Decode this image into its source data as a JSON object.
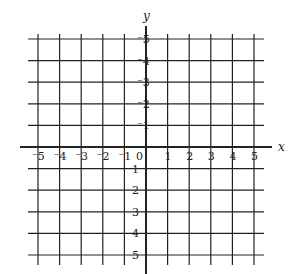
{
  "chart_data": {
    "type": "coordinate-grid",
    "title": "",
    "xlabel": "x",
    "ylabel": "y",
    "xlim": [
      -5,
      5
    ],
    "ylim": [
      -5,
      5
    ],
    "grid": true,
    "x_ticks": [
      -5,
      -4,
      -3,
      -2,
      -1,
      0,
      1,
      2,
      3,
      4,
      5
    ],
    "y_ticks": [
      -5,
      -4,
      -3,
      -2,
      -1,
      1,
      2,
      3,
      4,
      5
    ],
    "x_tick_labels": [
      "⁻5",
      "⁻4",
      "⁻3",
      "⁻2",
      "⁻1",
      "0",
      "1",
      "2",
      "3",
      "4",
      "5"
    ],
    "y_tick_labels": [
      "5",
      "4",
      "3",
      "2",
      "1",
      "⁻1",
      "⁻2",
      "⁻3",
      "⁻4",
      "⁻5"
    ],
    "origin_label": "0"
  },
  "colors": {
    "line": "#222222",
    "background": "#ffffff"
  }
}
